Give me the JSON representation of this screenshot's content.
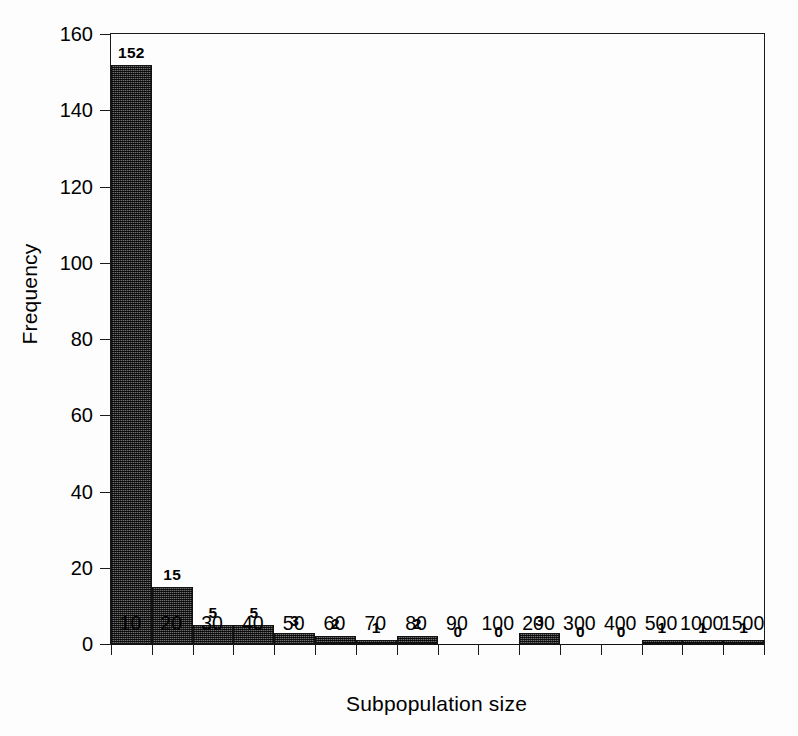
{
  "chart_data": {
    "type": "bar",
    "title": "",
    "subtitle": "",
    "xlabel": "Subpopulation size",
    "ylabel": "Frequency",
    "categories": [
      "10",
      "20",
      "30",
      "40",
      "50",
      "60",
      "70",
      "80",
      "90",
      "100",
      "200",
      "300",
      "400",
      "500",
      "1000",
      "1500"
    ],
    "values": [
      152,
      15,
      5,
      5,
      3,
      2,
      1,
      2,
      0,
      0,
      3,
      0,
      0,
      1,
      1,
      1
    ],
    "data_labels": [
      "152",
      "15",
      "5",
      "5",
      "3",
      "2",
      "1",
      "2",
      "0",
      "0",
      "3",
      "0",
      "0",
      "1",
      "1",
      "1"
    ],
    "ylim": [
      0,
      160
    ],
    "yticks": [
      0,
      20,
      40,
      60,
      80,
      100,
      120,
      140,
      160
    ],
    "ytick_labels": [
      "0",
      "20",
      "40",
      "60",
      "80",
      "100",
      "120",
      "140",
      "160"
    ],
    "grid": false,
    "legend": null,
    "legend_position": "none",
    "bar_style": "histogram-adjacent-hatched",
    "colors": {
      "bar_fill": "#6e6e6e",
      "bar_edge": "#121212",
      "axis": "#1a1a1a",
      "text": "#000000",
      "background": "#ffffff"
    }
  }
}
